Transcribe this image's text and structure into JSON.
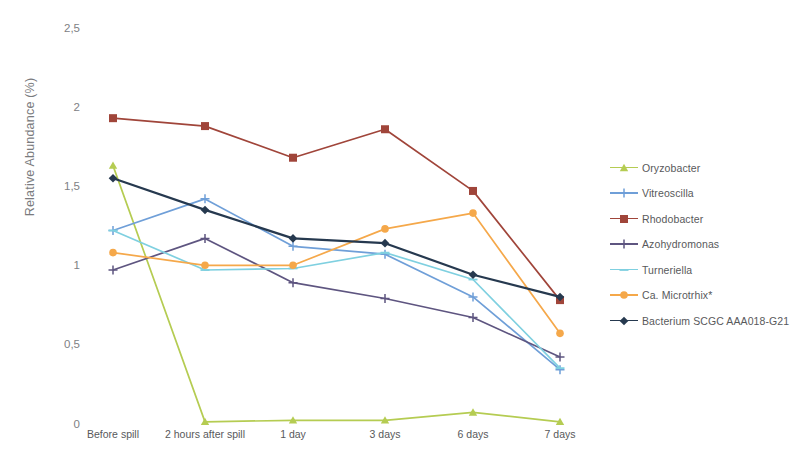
{
  "chart_data": {
    "type": "line",
    "title": "",
    "xlabel": "",
    "ylabel": "Relative Abundance (%)",
    "categories": [
      "Before spill",
      "2 hours after spill",
      "1 day",
      "3 days",
      "6 days",
      "7 days"
    ],
    "ylim": [
      0,
      2.5
    ],
    "ytick_labels": [
      "0",
      "0,5",
      "1",
      "1,5",
      "2",
      "2,5"
    ],
    "ytick_values": [
      0,
      0.5,
      1,
      1.5,
      2,
      2.5
    ],
    "grid": false,
    "legend_position": "right",
    "series": [
      {
        "name": "Oryzobacter",
        "color": "#b5cc52",
        "marker": "triangle",
        "values": [
          1.63,
          0.01,
          0.02,
          0.02,
          0.07,
          0.01
        ]
      },
      {
        "name": "Vitreoscilla",
        "color": "#6f9fd8",
        "marker": "plus",
        "values": [
          1.22,
          1.42,
          1.12,
          1.07,
          0.8,
          0.34
        ]
      },
      {
        "name": "Rhodobacter",
        "color": "#a0453a",
        "marker": "square",
        "values": [
          1.93,
          1.88,
          1.68,
          1.86,
          1.47,
          0.78
        ]
      },
      {
        "name": "Azohydromonas",
        "color": "#5e5580",
        "marker": "plus",
        "values": [
          0.97,
          1.17,
          0.89,
          0.79,
          0.67,
          0.42
        ]
      },
      {
        "name": "Turneriella",
        "color": "#7fd0e0",
        "marker": "dash",
        "values": [
          1.22,
          0.97,
          0.98,
          1.08,
          0.91,
          0.35
        ]
      },
      {
        "name": "Ca. Microtrhix*",
        "color": "#f5a84a",
        "marker": "circle",
        "values": [
          1.08,
          1.0,
          1.0,
          1.23,
          1.33,
          0.57
        ]
      },
      {
        "name": "Bacterium SCGC AAA018-G21",
        "color": "#26394f",
        "marker": "diamond",
        "values": [
          1.55,
          1.35,
          1.17,
          1.14,
          0.94,
          0.8
        ]
      }
    ]
  }
}
